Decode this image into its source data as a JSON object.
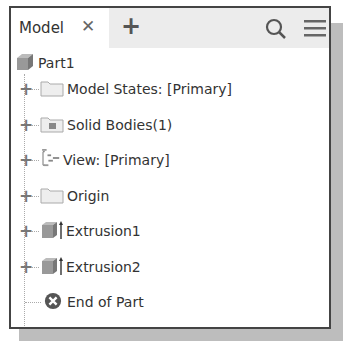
{
  "tab": {
    "label": "Model",
    "close_icon": "close-icon",
    "add_icon": "plus-icon"
  },
  "toolbar": {
    "search_icon": "search-icon",
    "menu_icon": "hamburger-menu-icon"
  },
  "tree": {
    "root": {
      "label": "Part1",
      "icon": "part-icon"
    },
    "items": [
      {
        "label": "Model States: [Primary]",
        "icon": "folder-icon",
        "expandable": true
      },
      {
        "label": "Solid Bodies(1)",
        "icon": "solid-bodies-folder-icon",
        "expandable": true
      },
      {
        "label": "View: [Primary]",
        "icon": "view-rep-icon",
        "expandable": true
      },
      {
        "label": "Origin",
        "icon": "folder-icon",
        "expandable": true
      },
      {
        "label": "Extrusion1",
        "icon": "extrusion-icon",
        "expandable": true
      },
      {
        "label": "Extrusion2",
        "icon": "extrusion-icon",
        "expandable": true
      },
      {
        "label": "End of Part",
        "icon": "end-of-part-icon",
        "expandable": false
      }
    ]
  }
}
